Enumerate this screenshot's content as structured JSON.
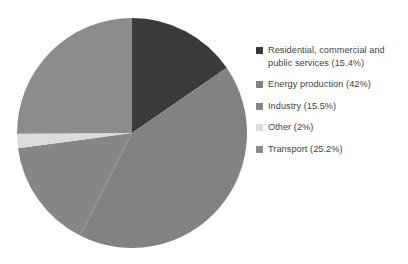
{
  "chart_data": {
    "type": "pie",
    "title": "",
    "categories": [
      "Residential, commercial and public services",
      "Energy production",
      "Transport",
      "Other",
      "Industry"
    ],
    "values": [
      15.4,
      42,
      25.2,
      2,
      15.5
    ],
    "unit": "%",
    "start_angle_deg": 0,
    "direction": "clockwise",
    "legend_position": "right",
    "grid": false,
    "slices": [
      {
        "name": "Residential, commercial and public services",
        "value": 15.4,
        "legend_text": "Residential, commercial and public services (15.4%)",
        "color": "#3a3a3a",
        "start_deg": 0,
        "end_deg": 55.44
      },
      {
        "name": "Energy production",
        "value": 42,
        "legend_text": "Energy production (42%)",
        "color": "#828282",
        "start_deg": 55.44,
        "end_deg": 206.64
      },
      {
        "name": "Industry",
        "value": 15.5,
        "legend_text": "Industry (15.5%)",
        "color": "#868686",
        "start_deg": 206.64,
        "end_deg": 262.44
      },
      {
        "name": "Other",
        "value": 2,
        "legend_text": "Other (2%)",
        "color": "#dcdcdc",
        "start_deg": 262.44,
        "end_deg": 269.64
      },
      {
        "name": "Transport",
        "value": 25.2,
        "legend_text": "Transport (25.2%)",
        "color": "#8c8c8c",
        "start_deg": 269.64,
        "end_deg": 360
      }
    ]
  },
  "legend": {
    "items": [
      {
        "label": "Residential, commercial and public services (15.4%)",
        "color": "#3a3a3a"
      },
      {
        "label": "Energy production (42%)",
        "color": "#828282"
      },
      {
        "label": "Industry (15.5%)",
        "color": "#868686"
      },
      {
        "label": "Other (2%)",
        "color": "#dcdcdc"
      },
      {
        "label": "Transport (25.2%)",
        "color": "#8c8c8c"
      }
    ]
  },
  "style": {
    "background": "#ffffff",
    "text_color": "#3f3f3f"
  }
}
